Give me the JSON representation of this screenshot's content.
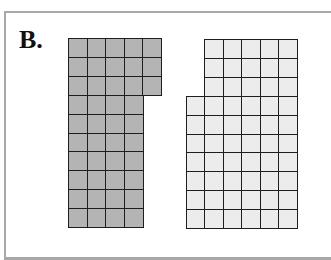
{
  "figure": {
    "label": "B.",
    "colors": {
      "shape_a_fill": "#b4b4b4",
      "shape_b_fill": "#ececec",
      "grid_line": "#1e1e1e",
      "frame": "#a8a8a8"
    },
    "shapes": [
      {
        "name": "shaded-shape",
        "origin": {
          "x": 68,
          "y": 38
        },
        "cell_w": 18.6,
        "cell_h": 18.9,
        "rows": [
          {
            "start_col": 0,
            "cols": 5
          },
          {
            "start_col": 0,
            "cols": 5
          },
          {
            "start_col": 0,
            "cols": 5
          },
          {
            "start_col": 0,
            "cols": 4
          },
          {
            "start_col": 0,
            "cols": 4
          },
          {
            "start_col": 0,
            "cols": 4
          },
          {
            "start_col": 0,
            "cols": 4
          },
          {
            "start_col": 0,
            "cols": 4
          },
          {
            "start_col": 0,
            "cols": 4
          },
          {
            "start_col": 0,
            "cols": 4
          }
        ],
        "total_squares": 43
      },
      {
        "name": "unshaded-shape",
        "origin": {
          "x": 186,
          "y": 39
        },
        "cell_w": 18.4,
        "cell_h": 18.9,
        "rows": [
          {
            "start_col": 1,
            "cols": 5
          },
          {
            "start_col": 1,
            "cols": 5
          },
          {
            "start_col": 1,
            "cols": 5
          },
          {
            "start_col": 0,
            "cols": 6
          },
          {
            "start_col": 0,
            "cols": 6
          },
          {
            "start_col": 0,
            "cols": 6
          },
          {
            "start_col": 0,
            "cols": 6
          },
          {
            "start_col": 0,
            "cols": 6
          },
          {
            "start_col": 0,
            "cols": 6
          },
          {
            "start_col": 0,
            "cols": 6
          }
        ],
        "total_squares": 57
      }
    ]
  }
}
